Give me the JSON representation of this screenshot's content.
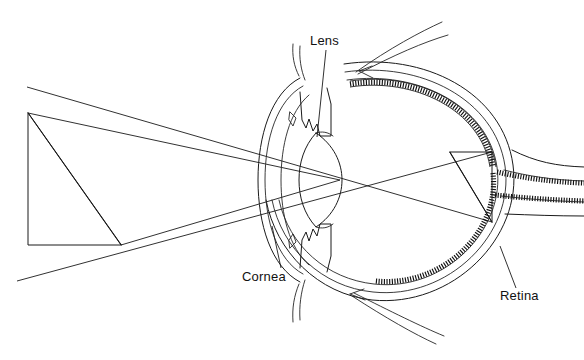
{
  "figure": {
    "background_color": "#ffffff",
    "ink_color": "#1a1a1a",
    "width": 584,
    "height": 360
  },
  "labels": {
    "lens": "Lens",
    "cornea": "Cornea",
    "retina": "Retina"
  },
  "label_positions": {
    "lens": {
      "x": 310,
      "y": 45
    },
    "cornea": {
      "x": 242,
      "y": 281
    },
    "retina": {
      "x": 500,
      "y": 300
    }
  },
  "leader_lines": {
    "lens": "M326,50 L317,137",
    "cornea": "M281,268 L272,226",
    "retina": "M516,288 L500,246"
  },
  "object_triangle": {
    "name": "object-arrow-triangle",
    "points": "28,113 28,245 121,245",
    "hypotenuse": "M28,113 L121,245"
  },
  "image_triangle": {
    "name": "inverted-image-triangle",
    "points": "450,152 492,152 492,222",
    "hypotenuse": "M450,152 L492,222"
  },
  "rays": [
    {
      "name": "ray-top-to-image-bottom",
      "path": "M27,87 L492,222"
    },
    {
      "name": "ray-bottom-to-image-top",
      "path": "M17,281 L492,152"
    },
    {
      "name": "ray-object-base-upper",
      "path": "M121,245 L340,180"
    },
    {
      "name": "ray-object-apex-lower",
      "path": "M28,113 L340,180"
    }
  ],
  "anatomy": {
    "sclera_outer": "M344,64 C424,52 503,92 513,165 C523,238 452,308 372,300 C318,294 276,252 266,200",
    "sclera_inner": "M345,72 C420,61 495,99 505,166 C515,234 448,300 373,292 C322,287 282,249 272,200",
    "choroid": "M347,80 C418,70 488,106 497,167 C506,230 444,292 374,284 C327,279 289,246 279,200",
    "cornea_outer": "M300,78 C271,93 258,136 258,180 C258,224 271,267 300,282",
    "cornea_inner": "M303,86 C277,100 265,139 265,180 C265,221 277,260 303,274",
    "anterior_chamber": "M309,95 C289,112 281,146 281,180 C281,214 289,248 309,265",
    "lens_body": "M316,133 C334,145 342,163 342,180 C342,197 334,215 316,227 C304,214 299,197 299,180 C299,163 304,146 316,133",
    "lens_suspensory_top": "M316,133 C322,131 328,132 333,136",
    "lens_suspensory_bottom": "M316,227 C322,229 328,228 333,224",
    "iris_upper": "M300,92 L302,120 L306,128 L309,119 L313,131 L317,124 L320,136 L331,136 L331,104 L327,88",
    "iris_lower": "M300,268 L302,240 L306,232 L309,241 L313,229 L317,236 L320,224 L331,224 L331,256 L327,272",
    "ciliary_upper_detail": "M290,112 L296,118 L293,126 L289,120 Z",
    "ciliary_lower_detail": "M290,248 L296,242 L293,234 L289,240 Z",
    "optic_nerve_upper_edge": "M504,170 C528,176 552,180 584,181",
    "optic_nerve_lower_edge": "M501,196 C527,199 553,201 584,202",
    "optic_nerve_sheath_upper": "M512,150 C536,162 556,166 584,167",
    "optic_nerve_sheath_lower": "M505,214 C532,215 556,216 584,216",
    "muscle_top_upper": "M356,72 C390,48 420,32 442,22",
    "muscle_top_mid": "M358,74 C394,55 424,42 448,35",
    "muscle_top_arrow": "M359,71 L372,66 M359,71 L373,78",
    "muscle_bottom_upper": "M352,296 C386,318 414,334 436,344",
    "muscle_bottom_mid": "M354,293 C392,312 420,326 444,336",
    "muscle_bottom_arrow": "M350,294 L364,289 M350,294 L365,300",
    "lacrimal_upper": "M299,76 C294,66 292,56 293,44",
    "lacrimal_upper2": "M305,80 C301,70 299,58 300,46",
    "lacrimal_lower": "M299,284 C294,296 292,308 293,322",
    "lacrimal_lower2": "M305,280 C301,292 299,306 300,320"
  },
  "retina": {
    "band_upper": "M350,84 C416,74 484,108 493,167",
    "band_lower": "M493,173 C500,232 442,288 375,281",
    "band_optic_upper": "M497,172 C524,178 552,182 584,183",
    "band_optic_lower": "M495,195 C524,198 552,200 584,201",
    "edge_inner_upper": "M350,87 C414,77 481,110 490,167",
    "edge_outer_upper": "M350,81 C418,71 487,106 496,167"
  }
}
